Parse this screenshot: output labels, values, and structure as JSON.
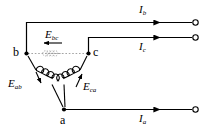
{
  "figure": {
    "kind": "delta-connected-three-phase-source-schematic",
    "background_color": "#ffffff",
    "line_color": "#000000",
    "faint_line_color": "#8a8a8a"
  },
  "nodes": [
    {
      "id": "a",
      "label": "a",
      "x": 64,
      "y": 110
    },
    {
      "id": "b",
      "label": "b",
      "x": 25,
      "y": 53
    },
    {
      "id": "c",
      "label": "c",
      "x": 90,
      "y": 53
    }
  ],
  "sources": [
    {
      "id": "ab",
      "label": "E",
      "subscript": "ab",
      "arrow": "down"
    },
    {
      "id": "bc",
      "label": "E",
      "subscript": "bc",
      "arrow": "left"
    },
    {
      "id": "ca",
      "label": "E",
      "subscript": "ca",
      "arrow": "up-right"
    }
  ],
  "lines": [
    {
      "id": "a",
      "label": "I",
      "subscript": "a",
      "terminal_y": 110
    },
    {
      "id": "b",
      "label": "I",
      "subscript": "b",
      "terminal_y": 22
    },
    {
      "id": "c",
      "label": "I",
      "subscript": "c",
      "terminal_y": 37
    }
  ],
  "labels": {
    "node_a": "a",
    "node_b": "b",
    "node_c": "c",
    "e_ab": "E",
    "e_ab_sub": "ab",
    "e_bc": "E",
    "e_bc_sub": "bc",
    "e_ca": "E",
    "e_ca_sub": "ca",
    "i_a": "I",
    "i_a_sub": "a",
    "i_b": "I",
    "i_b_sub": "b",
    "i_c": "I",
    "i_c_sub": "c"
  }
}
